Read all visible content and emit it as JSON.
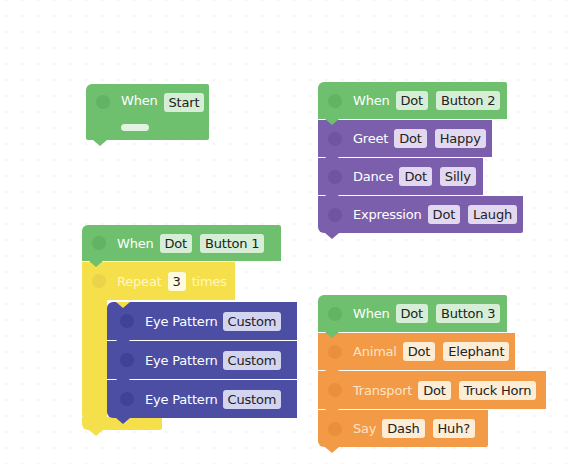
{
  "canvas": {
    "background": "#ffffff"
  },
  "colors": {
    "event_green": "#6ebf6e",
    "looks_purple": "#7b5fad",
    "lights_indigo": "#4b4ea3",
    "control_yellow": "#f5df4b",
    "sound_orange": "#f29a45"
  },
  "stacks": {
    "start": {
      "when": {
        "label": "When",
        "trigger": "Start"
      }
    },
    "button2": {
      "when": {
        "label": "When",
        "robot": "Dot",
        "trigger": "Button 2"
      },
      "blocks": [
        {
          "label": "Greet",
          "robot": "Dot",
          "value": "Happy"
        },
        {
          "label": "Dance",
          "robot": "Dot",
          "value": "Silly"
        },
        {
          "label": "Expression",
          "robot": "Dot",
          "value": "Laugh"
        }
      ]
    },
    "button1": {
      "when": {
        "label": "When",
        "robot": "Dot",
        "trigger": "Button 1"
      },
      "repeat": {
        "label": "Repeat",
        "count": "3",
        "suffix": "times"
      },
      "blocks": [
        {
          "label": "Eye Pattern",
          "value": "Custom"
        },
        {
          "label": "Eye Pattern",
          "value": "Custom"
        },
        {
          "label": "Eye Pattern",
          "value": "Custom"
        }
      ]
    },
    "button3": {
      "when": {
        "label": "When",
        "robot": "Dot",
        "trigger": "Button 3"
      },
      "blocks": [
        {
          "label": "Animal",
          "robot": "Dot",
          "value": "Elephant"
        },
        {
          "label": "Transport",
          "robot": "Dot",
          "value": "Truck Horn"
        },
        {
          "label": "Say",
          "robot": "Dash",
          "value": "Huh?"
        }
      ]
    }
  }
}
